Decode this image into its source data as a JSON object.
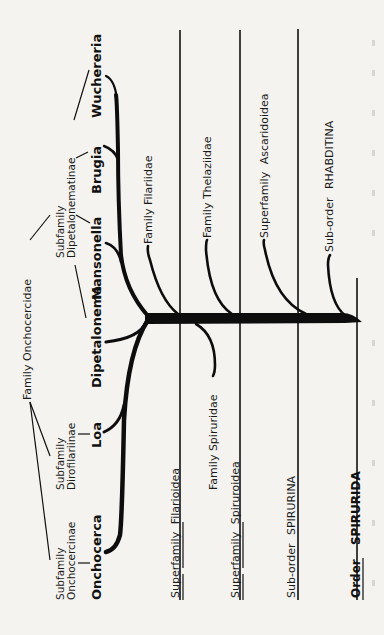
{
  "figure": {
    "orientation": "rotated-90-ccw",
    "background_color": "#f4f3ef",
    "ink_color": "#111111",
    "order": {
      "prefix": "Order",
      "name": "SPIRURIDA"
    },
    "suborders": [
      {
        "prefix": "Sub-order",
        "name": "SPIRURINA"
      },
      {
        "prefix": "Sub-order",
        "name": "RHABDITINA"
      }
    ],
    "superfamilies": [
      {
        "prefix": "Superfamily",
        "name": "Filarioidea"
      },
      {
        "prefix": "Superfamily",
        "name": "Spiruroidea"
      },
      {
        "prefix": "Superfamily",
        "name": "Ascaridoidea"
      }
    ],
    "families": [
      {
        "label": "Family Onchocercidae"
      },
      {
        "label": "Family Filariidae"
      },
      {
        "label": "Family Thelaziidae"
      },
      {
        "label": "Family Spiruridae"
      }
    ],
    "subfamilies": [
      {
        "line1": "Subfamily",
        "line2": "Onchocercinae"
      },
      {
        "line1": "Subfamily",
        "line2": "Dirofilariinae"
      },
      {
        "line1": "Subfamily",
        "line2": "Dipetalonematinae"
      }
    ],
    "genera": [
      {
        "name": "Onchocerca"
      },
      {
        "name": "Loa"
      },
      {
        "name": "Dipetalonema"
      },
      {
        "name": "Mansonella"
      },
      {
        "name": "Brugia"
      },
      {
        "name": "Wuchereria"
      }
    ]
  }
}
